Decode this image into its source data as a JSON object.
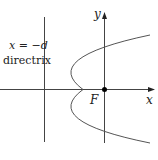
{
  "diagram": {
    "type": "parabola-with-directrix",
    "directrix_equation": "x = −d",
    "directrix_label": "directrix",
    "focus_label": "F",
    "x_axis_label": "x",
    "y_axis_label": "y",
    "colors": {
      "axis": "#333333",
      "curve": "#555555",
      "point": "#000000",
      "background": "#ffffff"
    }
  }
}
